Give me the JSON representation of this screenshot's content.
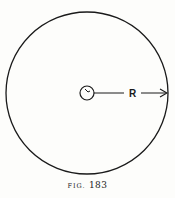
{
  "figure": {
    "label_prefix": "FIG.",
    "number": "183",
    "radius_label": "R"
  },
  "colors": {
    "ink": "#1a1a1a",
    "paper": "#fdfdfb"
  }
}
